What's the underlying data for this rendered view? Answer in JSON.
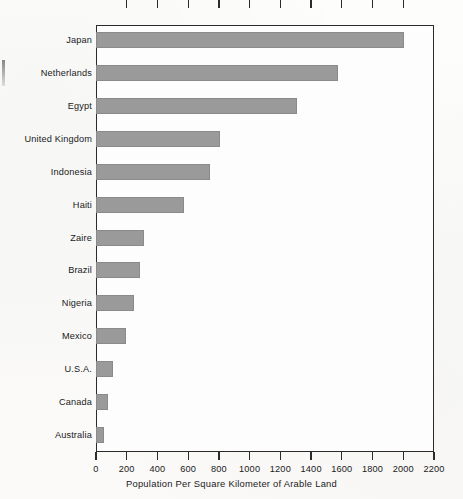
{
  "chart_data": {
    "type": "bar",
    "orientation": "horizontal",
    "title": "",
    "xlabel": "Population Per Square Kilometer of Arable Land",
    "ylabel": "",
    "xlim": [
      0,
      2200
    ],
    "xticks": [
      0,
      200,
      400,
      600,
      800,
      1000,
      1200,
      1400,
      1600,
      1800,
      2000,
      2200
    ],
    "grid": false,
    "legend": null,
    "bar_color": "#9a9a9a",
    "frame_color": "#2b2b2b",
    "background": "#fdfdfd",
    "categories": [
      "Japan",
      "Netherlands",
      "Egypt",
      "United Kingdom",
      "Indonesia",
      "Haiti",
      "Zaire",
      "Brazil",
      "Nigeria",
      "Mexico",
      "U.S.A.",
      "Canada",
      "Australia"
    ],
    "values": [
      2005,
      1575,
      1310,
      805,
      740,
      570,
      315,
      285,
      250,
      195,
      110,
      75,
      50
    ]
  }
}
